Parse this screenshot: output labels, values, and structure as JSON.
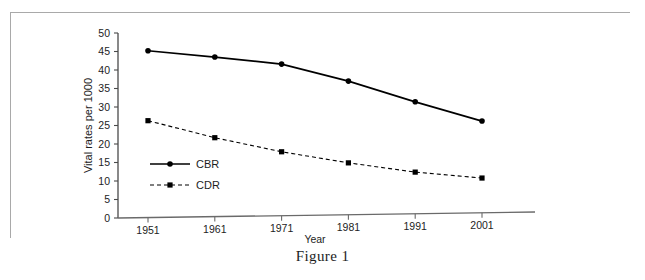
{
  "figure": {
    "caption": "Figure 1"
  },
  "chart_data": {
    "type": "line",
    "title": "",
    "xlabel": "Year",
    "ylabel": "Vital rates per 1000",
    "categories": [
      "1951",
      "1961",
      "1971",
      "1981",
      "1991",
      "2001"
    ],
    "x": [
      1951,
      1961,
      1971,
      1981,
      1991,
      2001
    ],
    "xlim": [
      1946,
      2006
    ],
    "ylim": [
      0,
      50
    ],
    "yticks": [
      "0",
      "5",
      "10",
      "15",
      "20",
      "25",
      "30",
      "35",
      "40",
      "45",
      "50"
    ],
    "ytick_values": [
      0,
      5,
      10,
      15,
      20,
      25,
      30,
      35,
      40,
      45,
      50
    ],
    "grid": false,
    "legend_position": "inside-lower-left",
    "series": [
      {
        "name": "CBR",
        "label": "CBR",
        "values": [
          45.2,
          43.5,
          41.6,
          37.0,
          31.4,
          26.2
        ],
        "color": "#000000",
        "line_style": "solid",
        "marker": "circle"
      },
      {
        "name": "CDR",
        "label": "CDR",
        "values": [
          26.3,
          21.7,
          17.9,
          14.9,
          12.4,
          10.8
        ],
        "color": "#000000",
        "line_style": "dashed",
        "marker": "square"
      }
    ]
  }
}
